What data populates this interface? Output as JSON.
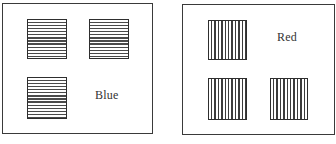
{
  "figure": {
    "panels": [
      {
        "id": "left",
        "label": "Blue",
        "stripe_orientation": "horizontal",
        "square_count": 3
      },
      {
        "id": "right",
        "label": "Red",
        "stripe_orientation": "vertical",
        "square_count": 3
      }
    ]
  },
  "colors": {
    "line": "#3a3a3a",
    "background": "#ffffff"
  }
}
